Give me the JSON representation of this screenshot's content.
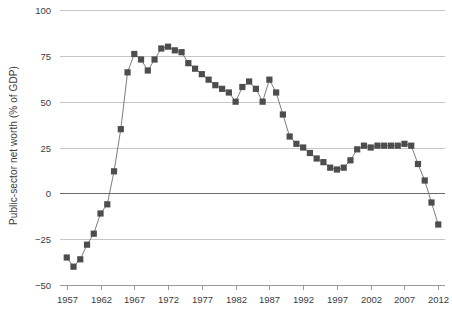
{
  "chart_data": {
    "type": "line",
    "title": "",
    "subtitle": "",
    "xlabel": "",
    "ylabel": "Public-sector net worth (% of GDP)",
    "xlim": [
      1956,
      2013
    ],
    "ylim": [
      -50,
      100
    ],
    "grid": true,
    "legend": null,
    "y_ticks": [
      100,
      75,
      50,
      25,
      0,
      -25,
      -50
    ],
    "y_tick_labels": [
      "100",
      "75",
      "50",
      "25",
      "0",
      "−25",
      "−50"
    ],
    "x_ticks": [
      1957,
      1962,
      1967,
      1972,
      1977,
      1982,
      1987,
      1992,
      1997,
      2002,
      2007,
      2012
    ],
    "x_tick_labels": [
      "1957",
      "1962",
      "1967",
      "1972",
      "1977",
      "1982",
      "1987",
      "1992",
      "1997",
      "2002",
      "2007",
      "2012"
    ],
    "marker": "square",
    "colors": {
      "marker": "#4d4d4d",
      "line": "#6e6e6e",
      "grid": "#c6c6c6",
      "zero_line": "#6b6b6b",
      "axis": "#9a9a9a",
      "text": "#3d3d3d",
      "background": "#ffffff"
    },
    "x": [
      1957,
      1958,
      1959,
      1960,
      1961,
      1962,
      1963,
      1964,
      1965,
      1966,
      1967,
      1968,
      1969,
      1970,
      1971,
      1972,
      1973,
      1974,
      1975,
      1976,
      1977,
      1978,
      1979,
      1980,
      1981,
      1982,
      1983,
      1984,
      1985,
      1986,
      1987,
      1988,
      1989,
      1990,
      1991,
      1992,
      1993,
      1994,
      1995,
      1996,
      1997,
      1998,
      1999,
      2000,
      2001,
      2002,
      2003,
      2004,
      2005,
      2006,
      2007,
      2008,
      2009,
      2010,
      2011,
      2012
    ],
    "y": [
      -35,
      -40,
      -36,
      -28,
      -22,
      -11,
      -6,
      12,
      35,
      66,
      76,
      73,
      67,
      73,
      79,
      80,
      78,
      77,
      71,
      68,
      65,
      62,
      59,
      57,
      55,
      50,
      58,
      61,
      57,
      50,
      62,
      55,
      43,
      31,
      27,
      25,
      22,
      19,
      17,
      14,
      13,
      14,
      18,
      24,
      26,
      25,
      26,
      26,
      26,
      26,
      27,
      26,
      16,
      7,
      -5,
      -17
    ]
  }
}
